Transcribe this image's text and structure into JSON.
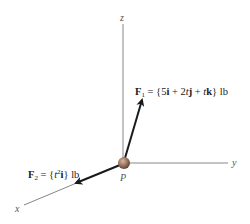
{
  "diagram": {
    "axes": {
      "x_label": "x",
      "y_label": "y",
      "z_label": "z"
    },
    "point": {
      "label": "P",
      "color": "#9c7660"
    },
    "forces": [
      {
        "name": "F1",
        "symbol": "F",
        "subscript": "1",
        "expression_prefix": " = {5",
        "i": "i",
        "plus1": " + 2",
        "t1": "t",
        "j": "j",
        "plus2": " + ",
        "t2": "t",
        "k": "k",
        "suffix": "} lb"
      },
      {
        "name": "F2",
        "symbol": "F",
        "subscript": "2",
        "expression_prefix": " = {",
        "t": "t",
        "power": "2",
        "i": "i",
        "suffix": "} lb"
      }
    ],
    "colors": {
      "axis": "#888888",
      "vector": "#1a1a1a",
      "text": "#222222"
    }
  }
}
